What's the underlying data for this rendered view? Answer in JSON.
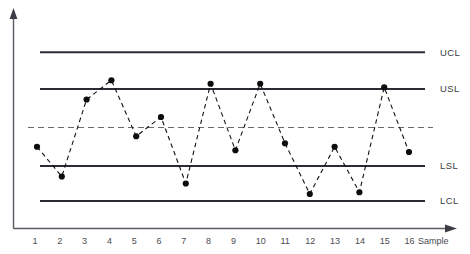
{
  "chart_data": {
    "type": "line",
    "title": "",
    "subtitle": "",
    "xlabel": "Sample",
    "ylabel": "",
    "grid": false,
    "legend_position": "right",
    "xlim": [
      0.5,
      16.8
    ],
    "ylim": [
      0,
      10
    ],
    "categories": [
      "1",
      "2",
      "3",
      "4",
      "5",
      "6",
      "7",
      "8",
      "9",
      "10",
      "11",
      "12",
      "13",
      "14",
      "15",
      "16"
    ],
    "x": [
      1,
      2,
      3,
      4,
      5,
      6,
      7,
      8,
      9,
      10,
      11,
      12,
      13,
      14,
      15,
      16
    ],
    "series": [
      {
        "name": "Sample measurement",
        "marker": "filled-circle",
        "line_style": "dashed",
        "color": "#111111",
        "values": [
          3.9,
          2.2,
          6.6,
          7.7,
          4.5,
          5.6,
          1.8,
          7.5,
          3.7,
          7.5,
          4.1,
          1.2,
          3.9,
          1.3,
          7.3,
          3.6
        ]
      }
    ],
    "reference_lines": [
      {
        "key": "ucl",
        "label": "UCL",
        "value": 9.3,
        "style": "solid",
        "color": "#2b2b33"
      },
      {
        "key": "usl",
        "label": "USL",
        "value": 7.2,
        "style": "solid",
        "color": "#2b2b33"
      },
      {
        "key": "center",
        "label": "",
        "value": 5.0,
        "style": "dashed",
        "color": "#6a6a72"
      },
      {
        "key": "lsl",
        "label": "LSL",
        "value": 2.8,
        "style": "solid",
        "color": "#2b2b33"
      },
      {
        "key": "lcl",
        "label": "LCL",
        "value": 0.8,
        "style": "solid",
        "color": "#2b2b33"
      }
    ],
    "axis_labels": {
      "x_tick_labels": [
        "1",
        "2",
        "3",
        "4",
        "5",
        "6",
        "7",
        "8",
        "9",
        "10",
        "11",
        "12",
        "13",
        "14",
        "15",
        "16"
      ],
      "x_axis_caption": "Sample"
    },
    "colors": {
      "background": "#ffffff",
      "axis": "#5a5a62",
      "limit_line": "#2b2b33",
      "center_line": "#6a6a72",
      "data_line": "#1a1a1a",
      "marker": "#0d0d0d",
      "text": "#3a3a42"
    }
  }
}
